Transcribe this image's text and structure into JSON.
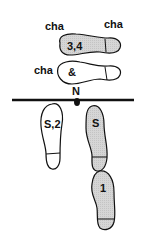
{
  "diagram": {
    "type": "dance-step-footprint-chart",
    "colors": {
      "stroke": "#111111",
      "shaded_fill": "#d2d2d2",
      "open_fill": "#ffffff",
      "line": "#111111"
    },
    "line_marker": {
      "label": "N"
    },
    "top_labels": {
      "left_cha": "cha",
      "right_cha": "cha",
      "middle_cha": "cha"
    },
    "footprints": [
      {
        "id": "fp-3-4",
        "label": "3,4",
        "shaded": true,
        "orientation": "horizontal-right"
      },
      {
        "id": "fp-and",
        "label": "&",
        "shaded": false,
        "orientation": "horizontal-right"
      },
      {
        "id": "fp-s2",
        "label": "S,2",
        "shaded": false,
        "orientation": "vertical-down"
      },
      {
        "id": "fp-s",
        "label": "S",
        "shaded": true,
        "orientation": "vertical-down"
      },
      {
        "id": "fp-1",
        "label": "1",
        "shaded": true,
        "orientation": "vertical-down"
      }
    ]
  }
}
